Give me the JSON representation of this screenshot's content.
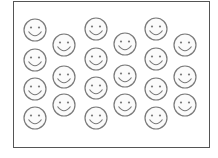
{
  "title": "Smiley faces",
  "count": 22,
  "style": {
    "stroke": "#7a7a7a",
    "fill": "#fbfbfb",
    "frame_color": "#555555",
    "radius": 11
  },
  "faces": [
    {
      "x": 35,
      "y": 30
    },
    {
      "x": 35,
      "y": 60
    },
    {
      "x": 35,
      "y": 89
    },
    {
      "x": 35,
      "y": 118
    },
    {
      "x": 64,
      "y": 45
    },
    {
      "x": 64,
      "y": 77
    },
    {
      "x": 64,
      "y": 105
    },
    {
      "x": 96,
      "y": 29
    },
    {
      "x": 96,
      "y": 59
    },
    {
      "x": 96,
      "y": 88
    },
    {
      "x": 96,
      "y": 118
    },
    {
      "x": 125,
      "y": 44
    },
    {
      "x": 125,
      "y": 76
    },
    {
      "x": 125,
      "y": 105
    },
    {
      "x": 156,
      "y": 29
    },
    {
      "x": 156,
      "y": 59
    },
    {
      "x": 156,
      "y": 89
    },
    {
      "x": 156,
      "y": 118
    },
    {
      "x": 185,
      "y": 45
    },
    {
      "x": 185,
      "y": 77
    },
    {
      "x": 185,
      "y": 105
    }
  ]
}
